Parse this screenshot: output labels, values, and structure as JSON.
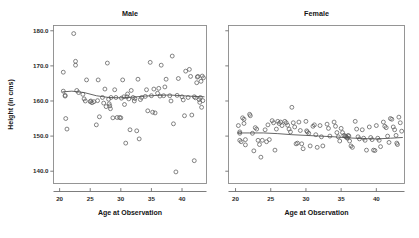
{
  "figure": {
    "ylabel": "Height (in cms)",
    "yticks": [
      "180.0",
      "170.0",
      "160.0",
      "150.0",
      "140.0"
    ],
    "ylim": [
      136.5,
      181.5
    ],
    "ytickvals": [
      180,
      170,
      160,
      150,
      140
    ]
  },
  "chart_data": {
    "type": "scatter",
    "title": "",
    "ylabel": "Height (in cms)",
    "xlabel": "Age at Observation",
    "ylim": [
      136.5,
      181.5
    ],
    "xlim": [
      19.0,
      44.0
    ],
    "yticks": [
      140,
      150,
      160,
      170,
      180
    ],
    "xticks": [
      20,
      25,
      30,
      35,
      40
    ],
    "ytick_labels": [
      "140.0",
      "150.0",
      "160.0",
      "170.0",
      "180.0"
    ],
    "xtick_labels": [
      "20",
      "25",
      "30",
      "35",
      "40"
    ],
    "grid": false,
    "legend": false,
    "marker": "open-circle",
    "panels": [
      {
        "label": "Male",
        "xlabel": "Age at Observation",
        "points": [
          [
            20.6,
            168.2
          ],
          [
            20.6,
            162.8
          ],
          [
            20.9,
            161.6
          ],
          [
            20.9,
            161.4
          ],
          [
            21.0,
            155.0
          ],
          [
            21.2,
            152.0
          ],
          [
            22.3,
            179.2
          ],
          [
            22.6,
            171.3
          ],
          [
            22.6,
            170.2
          ],
          [
            22.8,
            163.0
          ],
          [
            23.1,
            162.4
          ],
          [
            23.8,
            161.9
          ],
          [
            24.0,
            160.6
          ],
          [
            24.2,
            160.0
          ],
          [
            24.4,
            166.0
          ],
          [
            25.0,
            159.8
          ],
          [
            25.1,
            160.0
          ],
          [
            25.3,
            159.5
          ],
          [
            25.6,
            159.8
          ],
          [
            26.0,
            153.2
          ],
          [
            26.2,
            160.1
          ],
          [
            26.3,
            166.0
          ],
          [
            26.5,
            155.5
          ],
          [
            27.0,
            161.0
          ],
          [
            27.2,
            159.4
          ],
          [
            27.4,
            163.4
          ],
          [
            27.6,
            158.4
          ],
          [
            27.8,
            170.8
          ],
          [
            28.0,
            160.5
          ],
          [
            28.1,
            159.2
          ],
          [
            28.2,
            158.6
          ],
          [
            28.3,
            157.8
          ],
          [
            28.4,
            161.0
          ],
          [
            28.7,
            155.2
          ],
          [
            29.0,
            163.2
          ],
          [
            29.2,
            161.0
          ],
          [
            29.4,
            155.3
          ],
          [
            29.8,
            155.3
          ],
          [
            30.0,
            155.2
          ],
          [
            30.1,
            160.8
          ],
          [
            30.3,
            166.0
          ],
          [
            30.5,
            161.2
          ],
          [
            30.6,
            159.0
          ],
          [
            30.8,
            148.0
          ],
          [
            31.0,
            161.2
          ],
          [
            31.1,
            162.0
          ],
          [
            31.3,
            160.6
          ],
          [
            31.5,
            151.8
          ],
          [
            31.7,
            163.0
          ],
          [
            32.0,
            161.0
          ],
          [
            32.2,
            160.0
          ],
          [
            32.3,
            160.7
          ],
          [
            32.6,
            151.5
          ],
          [
            32.8,
            166.2
          ],
          [
            33.0,
            149.2
          ],
          [
            33.2,
            160.4
          ],
          [
            33.4,
            161.0
          ],
          [
            34.0,
            161.3
          ],
          [
            34.2,
            163.2
          ],
          [
            34.4,
            157.2
          ],
          [
            34.8,
            171.0
          ],
          [
            35.0,
            161.5
          ],
          [
            35.2,
            156.8
          ],
          [
            35.4,
            163.4
          ],
          [
            35.6,
            156.6
          ],
          [
            36.0,
            162.2
          ],
          [
            36.2,
            163.6
          ],
          [
            36.4,
            161.4
          ],
          [
            36.6,
            170.2
          ],
          [
            37.0,
            161.5
          ],
          [
            37.2,
            164.0
          ],
          [
            37.4,
            166.2
          ],
          [
            38.0,
            161.5
          ],
          [
            38.2,
            160.0
          ],
          [
            38.4,
            172.8
          ],
          [
            38.6,
            153.5
          ],
          [
            39.0,
            139.8
          ],
          [
            39.2,
            161.6
          ],
          [
            39.4,
            166.4
          ],
          [
            40.0,
            161.2
          ],
          [
            40.2,
            160.3
          ],
          [
            40.4,
            155.8
          ],
          [
            40.6,
            168.5
          ],
          [
            41.0,
            161.0
          ],
          [
            41.2,
            169.0
          ],
          [
            41.4,
            167.0
          ],
          [
            41.6,
            156.0
          ],
          [
            42.0,
            161.2
          ],
          [
            42.2,
            160.9
          ],
          [
            42.4,
            165.2
          ],
          [
            42.5,
            166.8
          ],
          [
            42.6,
            167.0
          ],
          [
            42.8,
            160.4
          ],
          [
            42.9,
            159.6
          ],
          [
            43.0,
            161.0
          ],
          [
            43.1,
            165.6
          ],
          [
            43.2,
            158.2
          ],
          [
            43.3,
            167.1
          ],
          [
            43.4,
            160.1
          ],
          [
            43.5,
            166.6
          ],
          [
            42.0,
            143.0
          ]
        ],
        "trend": [
          [
            20.5,
            162.6
          ],
          [
            22.0,
            162.8
          ],
          [
            24.0,
            162.4
          ],
          [
            26.0,
            161.5
          ],
          [
            28.0,
            161.0
          ],
          [
            30.0,
            160.9
          ],
          [
            32.0,
            161.1
          ],
          [
            34.0,
            161.4
          ],
          [
            36.0,
            161.6
          ],
          [
            38.0,
            161.7
          ],
          [
            40.0,
            161.5
          ],
          [
            42.0,
            161.3
          ],
          [
            43.6,
            161.2
          ]
        ]
      },
      {
        "label": "Female",
        "xlabel": "Age at Observation",
        "points": [
          [
            20.4,
            153.0
          ],
          [
            20.6,
            151.2
          ],
          [
            20.6,
            150.8
          ],
          [
            20.6,
            148.8
          ],
          [
            20.8,
            148.4
          ],
          [
            21.0,
            155.2
          ],
          [
            21.2,
            154.8
          ],
          [
            21.2,
            153.6
          ],
          [
            21.4,
            149.0
          ],
          [
            21.4,
            147.5
          ],
          [
            22.0,
            156.2
          ],
          [
            22.1,
            155.8
          ],
          [
            22.4,
            150.8
          ],
          [
            22.6,
            145.8
          ],
          [
            22.8,
            152.4
          ],
          [
            23.0,
            152.0
          ],
          [
            23.2,
            148.8
          ],
          [
            23.4,
            147.6
          ],
          [
            23.6,
            144.0
          ],
          [
            23.8,
            148.8
          ],
          [
            24.2,
            151.8
          ],
          [
            24.4,
            148.4
          ],
          [
            24.6,
            153.2
          ],
          [
            24.8,
            149.0
          ],
          [
            25.2,
            154.4
          ],
          [
            25.4,
            153.8
          ],
          [
            25.6,
            146.0
          ],
          [
            25.8,
            152.0
          ],
          [
            26.0,
            154.2
          ],
          [
            26.2,
            153.6
          ],
          [
            26.4,
            154.0
          ],
          [
            26.6,
            153.0
          ],
          [
            27.0,
            154.2
          ],
          [
            27.2,
            153.8
          ],
          [
            27.4,
            153.1
          ],
          [
            27.6,
            152.0
          ],
          [
            27.8,
            151.2
          ],
          [
            28.0,
            158.2
          ],
          [
            28.2,
            153.8
          ],
          [
            28.4,
            152.6
          ],
          [
            28.6,
            147.8
          ],
          [
            28.8,
            148.0
          ],
          [
            29.0,
            154.0
          ],
          [
            29.2,
            151.6
          ],
          [
            29.4,
            147.8
          ],
          [
            29.6,
            146.4
          ],
          [
            30.0,
            154.2
          ],
          [
            30.1,
            151.5
          ],
          [
            30.2,
            151.2
          ],
          [
            30.4,
            150.8
          ],
          [
            30.6,
            147.2
          ],
          [
            31.0,
            152.8
          ],
          [
            31.2,
            153.2
          ],
          [
            31.4,
            150.4
          ],
          [
            31.6,
            146.8
          ],
          [
            32.0,
            153.0
          ],
          [
            32.2,
            149.8
          ],
          [
            32.4,
            147.2
          ],
          [
            33.0,
            153.4
          ],
          [
            33.2,
            152.2
          ],
          [
            33.4,
            150.0
          ],
          [
            34.0,
            154.0
          ],
          [
            34.2,
            152.8
          ],
          [
            34.4,
            151.0
          ],
          [
            34.6,
            149.8
          ],
          [
            34.8,
            148.6
          ],
          [
            35.0,
            152.2
          ],
          [
            35.2,
            151.0
          ],
          [
            35.4,
            150.2
          ],
          [
            35.6,
            150.0
          ],
          [
            35.7,
            149.8
          ],
          [
            35.8,
            149.6
          ],
          [
            35.9,
            149.4
          ],
          [
            36.0,
            150.2
          ],
          [
            36.1,
            150.0
          ],
          [
            36.2,
            148.6
          ],
          [
            36.4,
            147.2
          ],
          [
            36.6,
            146.8
          ],
          [
            37.0,
            154.2
          ],
          [
            37.2,
            152.0
          ],
          [
            37.4,
            149.8
          ],
          [
            37.6,
            149.2
          ],
          [
            38.0,
            151.8
          ],
          [
            38.2,
            149.4
          ],
          [
            38.4,
            148.8
          ],
          [
            38.6,
            146.0
          ],
          [
            39.0,
            152.6
          ],
          [
            39.2,
            149.6
          ],
          [
            39.4,
            149.0
          ],
          [
            39.6,
            146.0
          ],
          [
            39.8,
            145.9
          ],
          [
            40.0,
            153.0
          ],
          [
            40.2,
            149.4
          ],
          [
            40.4,
            148.8
          ],
          [
            40.6,
            147.0
          ],
          [
            41.0,
            154.0
          ],
          [
            41.2,
            152.8
          ],
          [
            41.4,
            152.4
          ],
          [
            41.6,
            150.0
          ],
          [
            41.8,
            148.2
          ],
          [
            42.0,
            155.0
          ],
          [
            42.2,
            154.8
          ],
          [
            42.4,
            152.6
          ],
          [
            42.6,
            151.8
          ],
          [
            42.8,
            150.2
          ],
          [
            42.9,
            148.0
          ],
          [
            43.0,
            147.6
          ],
          [
            43.2,
            155.4
          ],
          [
            43.4,
            153.8
          ],
          [
            43.6,
            151.4
          ]
        ],
        "trend": [
          [
            20.3,
            150.9
          ],
          [
            22.0,
            150.9
          ],
          [
            24.0,
            150.9
          ],
          [
            26.0,
            150.7
          ],
          [
            28.0,
            150.4
          ],
          [
            30.0,
            150.2
          ],
          [
            32.0,
            150.0
          ],
          [
            34.0,
            149.8
          ],
          [
            36.0,
            149.5
          ],
          [
            38.0,
            149.3
          ],
          [
            40.0,
            149.2
          ],
          [
            42.0,
            149.4
          ],
          [
            43.7,
            149.6
          ]
        ]
      }
    ]
  }
}
